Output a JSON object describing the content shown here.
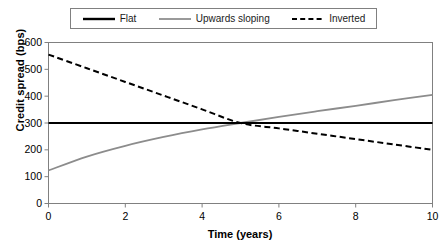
{
  "chart_data": {
    "type": "line",
    "title": "",
    "xlabel": "Time (years)",
    "ylabel": "Credit spread (bps)",
    "xlim": [
      0,
      10
    ],
    "ylim": [
      0,
      600
    ],
    "xticks": [
      0,
      2,
      4,
      6,
      8,
      10
    ],
    "yticks": [
      0,
      100,
      200,
      300,
      400,
      500,
      600
    ],
    "grid": false,
    "legend_position": "top",
    "series": [
      {
        "name": "Flat",
        "color": "#000000",
        "style": "solid",
        "width": 2.2,
        "x": [
          0,
          1,
          2,
          3,
          4,
          5,
          6,
          7,
          8,
          9,
          10
        ],
        "values": [
          300,
          300,
          300,
          300,
          300,
          300,
          300,
          300,
          300,
          300,
          300
        ]
      },
      {
        "name": "Upwards sloping",
        "color": "#8c8c8c",
        "style": "solid",
        "width": 1.8,
        "x": [
          0,
          1,
          2,
          3,
          4,
          5,
          6,
          7,
          8,
          9,
          10
        ],
        "values": [
          123,
          175,
          215,
          248,
          276,
          300,
          323,
          344,
          364,
          385,
          405
        ]
      },
      {
        "name": "Inverted",
        "color": "#000000",
        "style": "dashed",
        "width": 2.0,
        "x": [
          0,
          1,
          2,
          3,
          4,
          5,
          6,
          7,
          8,
          9,
          10
        ],
        "values": [
          555,
          504,
          453,
          402,
          351,
          300,
          280,
          260,
          240,
          220,
          200
        ]
      }
    ]
  },
  "legend": {
    "entries": [
      {
        "label": "Flat",
        "icon": "solid-black-line-icon"
      },
      {
        "label": "Upwards sloping",
        "icon": "solid-gray-line-icon"
      },
      {
        "label": "Inverted",
        "icon": "dashed-black-line-icon"
      }
    ]
  },
  "axes": {
    "y_title": "Credit spread (bps)",
    "x_title": "Time (years)",
    "y_tick_labels": [
      "600",
      "500",
      "400",
      "300",
      "200",
      "100",
      "0"
    ],
    "x_tick_labels": [
      "0",
      "2",
      "4",
      "6",
      "8",
      "10"
    ]
  },
  "colors": {
    "frame": "#808080",
    "flat": "#000000",
    "upwards": "#8c8c8c",
    "inverted": "#000000",
    "background": "#ffffff"
  }
}
